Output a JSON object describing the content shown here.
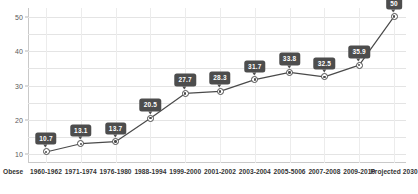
{
  "chart_data": {
    "type": "line",
    "title": "",
    "xlabel": "",
    "ylabel": "",
    "series_name": "Obese",
    "categories": [
      "1960-1962",
      "1971-1974",
      "1976-1980",
      "1988-1994",
      "1999-2000",
      "2001-2002",
      "2003-2004",
      "2005-5006",
      "2007-2008",
      "2009-2010",
      "Projected 2030"
    ],
    "values": [
      10.7,
      13.1,
      13.7,
      20.5,
      27.7,
      28.3,
      31.7,
      33.8,
      32.5,
      35.9,
      50
    ],
    "point_labels": [
      "10.7",
      "13.1",
      "13.7",
      "20.5",
      "27.7",
      "28.3",
      "31.7",
      "33.8",
      "32.5",
      "35.9",
      "50"
    ],
    "yticks": [
      10,
      20,
      30,
      40,
      50
    ],
    "ytick_labels": [
      "10",
      "20",
      "30",
      "40",
      "50"
    ],
    "ylim": [
      7.5,
      52.5
    ],
    "grid": true,
    "legend": "none",
    "colors": {
      "line": "#4a4a4a",
      "marker_fill": "#ffffff",
      "marker_stroke": "#4a4a4a",
      "label_bg": "#4d4d4d",
      "label_text": "#ffffff",
      "grid": "#e4e4e4",
      "axis": "#c9c9c9",
      "tick_text": "#5a5a5a",
      "category_text": "#333333",
      "background": "#ffffff"
    }
  }
}
